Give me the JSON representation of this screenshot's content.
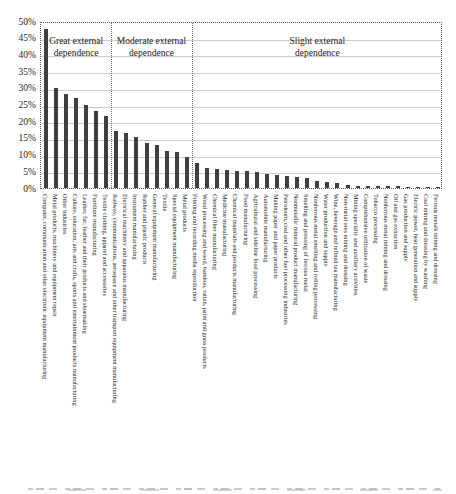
{
  "chart_data": {
    "type": "bar",
    "title": "",
    "xlabel": "",
    "ylabel": "",
    "ylim": [
      0,
      50
    ],
    "ytick_step": 5,
    "ytick_labels": [
      "0%",
      "5%",
      "10%",
      "15%",
      "20%",
      "25%",
      "30%",
      "35%",
      "40%",
      "45%",
      "50%"
    ],
    "grid": "horizontal light-gray solid lines every 5%, dotted outer frame",
    "legend_position": "none",
    "bar_color": "#3f3f3f",
    "groups": [
      {
        "label": "Great external dependence",
        "start_index": 0,
        "end_index": 6
      },
      {
        "label": "Moderate external dependence",
        "start_index": 7,
        "end_index": 14
      },
      {
        "label": "Slight external dependence",
        "start_index": 15,
        "end_index": 39
      }
    ],
    "categories": [
      "Computer, communication and other electronic equipment manufacturing",
      "Metal products, machinery and equipment repair",
      "Other industries",
      "Culture, education, arts and crafts, sports and entertainment products manufacturing",
      "Leather, fur, feather and their products and shoemaking",
      "Furniture manufacturing",
      "Textile clothing, apparel and accessories",
      "Railway, communications, aerospace and other transport equipment manufacturing",
      "Electrical machinery and apparatus manufacturing",
      "Instrument manufacturing",
      "Rubber and plastic products",
      "General equipment manufacturing",
      "Textile",
      "Special equipment manufacturing",
      "Metal products",
      "Printing and recording media reproduction",
      "Wood processing and wood, bamboo, rattan, palm and grass products",
      "Chemical fiber manufacturing",
      "Medicine manufacturing",
      "Chemical materials and products manufacturing",
      "Food manufacturing",
      "Agricultural and sideline food processing",
      "Automobile manufacturing",
      "Making paper and paper products",
      "Petroleum, coal and other fuel processing industries",
      "Nonmetallic mineral product manufacturing",
      "Smelting and pressing of ferrous metal",
      "Nonferrous metal smelting and rolling processing",
      "Water production and supply",
      "Wine, beverage and refined tea manufacturing",
      "Non-metal ores mining and dressing",
      "Mining specialty and auxiliary activities",
      "Comprehensive utilization of waste",
      "Tobacco processing",
      "Nonferrous metal mining and dressing",
      "Oil and gas extraction",
      "Gas production and supply",
      "Electric power, heat generation and supply",
      "Coal mining and dressing by washing",
      "Ferrous metals mining and dressing"
    ],
    "values": [
      47.5,
      30,
      28,
      27,
      25,
      23,
      21.5,
      17,
      16.5,
      15.2,
      13.5,
      13,
      11,
      10.7,
      9.3,
      7.5,
      6.0,
      5.7,
      5.4,
      5.2,
      5.0,
      4.7,
      4.2,
      3.8,
      3.5,
      3.2,
      3.0,
      2.0,
      1.8,
      1.5,
      0.8,
      0.7,
      0.6,
      0.55,
      0.5,
      0.5,
      0.45,
      0.45,
      0.4,
      0.35
    ]
  },
  "colors": {
    "bar": "#3f3f3f",
    "gridline": "#cccccc",
    "frame": "#595959",
    "divider": "#6e6e6e",
    "text": "#1a1a1a"
  }
}
